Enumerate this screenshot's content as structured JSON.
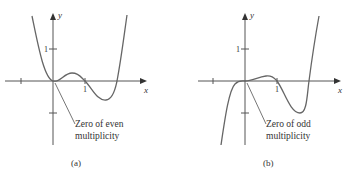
{
  "panels": [
    {
      "id": "a",
      "caption": "(a)",
      "x_axis_label": "x",
      "y_axis_label": "y",
      "x_tick_label": "1",
      "y_tick_label": "1",
      "annotation_line1": "Zero of even",
      "annotation_line2": "multiplicity"
    },
    {
      "id": "b",
      "caption": "(b)",
      "x_axis_label": "x",
      "y_axis_label": "y",
      "x_tick_label": "1",
      "y_tick_label": "1",
      "annotation_line1": "Zero of odd",
      "annotation_line2": "multiplicity"
    }
  ],
  "colors": {
    "axis": "#555555",
    "curve": "#666666",
    "text": "#333333"
  }
}
